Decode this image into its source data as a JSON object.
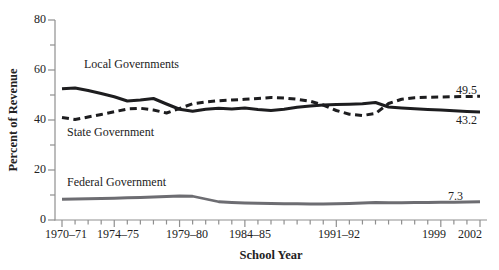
{
  "chart_data": {
    "type": "line",
    "title": "",
    "xlabel": "School Year",
    "ylabel": "Percent of Revenue",
    "ylim": [
      0,
      80
    ],
    "xlim_years": [
      1970,
      2002
    ],
    "grid": false,
    "legend_position": "inline-labels",
    "y_tick_labels": [
      "80",
      "60",
      "40",
      "20",
      "0"
    ],
    "y_major_tick_values": [
      0,
      20,
      40,
      60,
      80
    ],
    "y_minor_tick_values": [
      10,
      30,
      50,
      70
    ],
    "x_tick_labels": [
      "1970–71",
      "1974–75",
      "1979–80",
      "1984–85",
      "1991–92",
      "1999",
      "2002"
    ],
    "x_major_tick_years": [
      1970,
      1974,
      1979,
      1984,
      1991,
      1999,
      2002
    ],
    "x_years": [
      1970,
      1971,
      1972,
      1973,
      1974,
      1975,
      1976,
      1977,
      1978,
      1979,
      1980,
      1981,
      1982,
      1983,
      1984,
      1985,
      1986,
      1987,
      1988,
      1989,
      1990,
      1991,
      1992,
      1993,
      1994,
      1995,
      1996,
      1997,
      1998,
      1999,
      2000,
      2001,
      2002
    ],
    "series": [
      {
        "name": "Local Governments",
        "style": "solid",
        "color": "#1d1d1f",
        "width": 3,
        "end_label": "43.2",
        "values": [
          52.5,
          52.8,
          51.8,
          50.6,
          49.3,
          47.6,
          48.0,
          48.6,
          46.4,
          44.3,
          43.5,
          44.3,
          44.7,
          44.4,
          44.8,
          44.2,
          43.8,
          44.3,
          45.1,
          45.6,
          46.0,
          46.2,
          46.3,
          46.5,
          47.0,
          45.2,
          44.8,
          44.5,
          44.2,
          44.0,
          43.7,
          43.4,
          43.2
        ]
      },
      {
        "name": "State Government",
        "style": "dashed",
        "color": "#1d1d1f",
        "width": 3,
        "end_label": "49.5",
        "values": [
          41.0,
          40.2,
          41.2,
          42.2,
          43.3,
          44.4,
          44.7,
          44.0,
          42.8,
          44.6,
          46.5,
          47.2,
          47.7,
          48.0,
          48.3,
          48.6,
          49.0,
          48.8,
          48.3,
          47.5,
          46.0,
          43.8,
          42.3,
          41.8,
          42.6,
          46.6,
          48.3,
          48.9,
          49.1,
          49.2,
          49.3,
          49.4,
          49.5
        ]
      },
      {
        "name": "Federal Government",
        "style": "solid",
        "color": "#6d6d72",
        "width": 2.8,
        "end_label": "7.3",
        "values": [
          8.3,
          8.4,
          8.5,
          8.6,
          8.7,
          8.9,
          9.0,
          9.2,
          9.4,
          9.6,
          9.5,
          8.4,
          7.3,
          7.0,
          6.8,
          6.7,
          6.6,
          6.5,
          6.5,
          6.4,
          6.4,
          6.5,
          6.6,
          6.8,
          7.0,
          6.9,
          6.9,
          7.0,
          7.0,
          7.1,
          7.1,
          7.2,
          7.3
        ]
      }
    ],
    "axis_color": "#8f8f8f"
  }
}
